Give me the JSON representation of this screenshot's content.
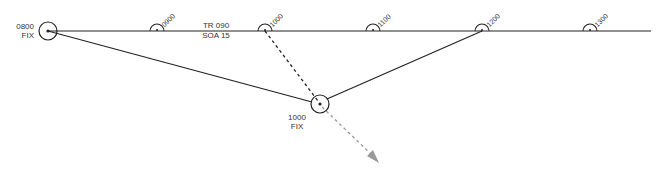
{
  "diagram": {
    "track": {
      "label_top": "TR 090",
      "label_bottom": "SOA 15"
    },
    "fixes": [
      {
        "time": "0800",
        "label": "FIX"
      },
      {
        "time": "1000",
        "label": "FIX"
      }
    ],
    "dr_positions": [
      "0900",
      "1000",
      "1100",
      "1200",
      "1300"
    ],
    "colors": {
      "line": "#222222",
      "set_drift": "#999999",
      "text": "#333333"
    }
  }
}
